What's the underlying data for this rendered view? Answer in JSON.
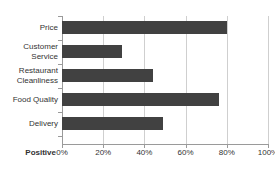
{
  "chart_data": {
    "type": "bar",
    "orientation": "horizontal",
    "title": "",
    "categories": [
      "Price",
      "Customer Service",
      "Restaurant Cleanliness",
      "Food Quality",
      "Delivery"
    ],
    "values": [
      80,
      29,
      44,
      76,
      49
    ],
    "xlabel": "Positive",
    "ylabel": "",
    "xlim": [
      0,
      100
    ],
    "xticks": [
      0,
      20,
      40,
      60,
      80,
      100
    ],
    "xticklabels": [
      "0%",
      "20%",
      "40%",
      "60%",
      "80%",
      "100%"
    ],
    "grid": true,
    "legend": false,
    "bar_color": "#414141",
    "gridline_color": "#cfcfcf",
    "axis_color": "#9a9a9a"
  },
  "category_lines": [
    [
      "Price"
    ],
    [
      "Customer",
      "Service"
    ],
    [
      "Restaurant",
      "Cleanliness"
    ],
    [
      "Food Quality"
    ],
    [
      "Delivery"
    ]
  ]
}
